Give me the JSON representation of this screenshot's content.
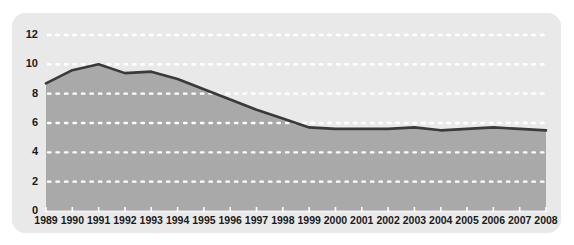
{
  "chart_data": {
    "type": "area",
    "title": "",
    "subtitle": "",
    "xlabel": "",
    "ylabel": "",
    "categories": [
      "1989",
      "1990",
      "1991",
      "1992",
      "1993",
      "1994",
      "1995",
      "1996",
      "1997",
      "1998",
      "1999",
      "2000",
      "2001",
      "2002",
      "2003",
      "2004",
      "2005",
      "2006",
      "2007",
      "2008"
    ],
    "values": [
      8.7,
      9.6,
      10.0,
      9.4,
      9.5,
      9.0,
      8.3,
      7.6,
      6.9,
      6.3,
      5.7,
      5.6,
      5.6,
      5.6,
      5.7,
      5.5,
      5.6,
      5.7,
      5.6,
      5.5
    ],
    "series": [
      {
        "name": "series-1",
        "values": [
          8.7,
          9.6,
          10.0,
          9.4,
          9.5,
          9.0,
          8.3,
          7.6,
          6.9,
          6.3,
          5.7,
          5.6,
          5.6,
          5.6,
          5.7,
          5.5,
          5.6,
          5.7,
          5.6,
          5.5
        ]
      }
    ],
    "ylim": [
      0,
      12
    ],
    "ytick_values": [
      0,
      2,
      4,
      6,
      8,
      10,
      12
    ],
    "ytick_labels": [
      "0",
      "2",
      "4",
      "6",
      "8",
      "10",
      "12"
    ],
    "xtick_labels": [
      "1989",
      "1990",
      "1991",
      "1992",
      "1993",
      "1994",
      "1995",
      "1996",
      "1997",
      "1998",
      "1999",
      "2000",
      "2001",
      "2002",
      "2003",
      "2004",
      "2005",
      "2006",
      "2007",
      "2008"
    ],
    "grid": true,
    "grid_style": "dotted-horizontal-white",
    "legend": false,
    "legend_position": "none",
    "annotations": []
  },
  "style": {
    "card_background": "#e9e9e9",
    "plot_background": "#e6e6e6",
    "area_fill": "#a9a9a9",
    "line_color": "#3a3a3a",
    "grid_color": "#ffffff",
    "tick_color": "#ffffff",
    "label_color": "#1a1a1a",
    "page_background": "#ffffff"
  }
}
